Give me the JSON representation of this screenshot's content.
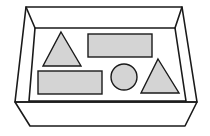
{
  "diagram": {
    "colors": {
      "background": "#ffffff",
      "outline": "#1a1a1a",
      "shape_fill": "#d4d4d4",
      "box_fill": "#ffffff"
    },
    "box": {
      "outer_rim": [
        [
          26,
          7
        ],
        [
          182,
          7
        ],
        [
          197,
          102
        ],
        [
          15,
          102
        ]
      ],
      "inner_back": [
        [
          35,
          28
        ],
        [
          175,
          28
        ],
        [
          186,
          101
        ],
        [
          29,
          101
        ]
      ],
      "front_face": [
        [
          15,
          102
        ],
        [
          197,
          102
        ],
        [
          185,
          126
        ],
        [
          30,
          126
        ]
      ]
    },
    "shapes": [
      {
        "type": "triangle",
        "name": "triangle-left",
        "points": [
          [
            61,
            32
          ],
          [
            81,
            66
          ],
          [
            43,
            66
          ]
        ]
      },
      {
        "type": "rectangle",
        "name": "rectangle-top",
        "x": 88,
        "y": 34,
        "width": 64,
        "height": 23
      },
      {
        "type": "rectangle",
        "name": "rectangle-bottom",
        "x": 38,
        "y": 71,
        "width": 64,
        "height": 23
      },
      {
        "type": "circle",
        "name": "circle",
        "cx": 124,
        "cy": 77,
        "r": 13
      },
      {
        "type": "triangle",
        "name": "triangle-right",
        "points": [
          [
            158,
            59
          ],
          [
            179,
            93
          ],
          [
            141,
            93
          ]
        ]
      }
    ]
  }
}
